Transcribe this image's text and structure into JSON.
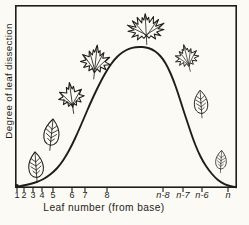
{
  "figure": {
    "title": "",
    "ylabel": "Degree of leaf dissection",
    "xlabel": "Leaf number (from base)"
  },
  "colors": {
    "ink": "#1e1d1a",
    "background": "#fbfaf5"
  },
  "axis": {
    "x_ticks": [
      {
        "label": "1",
        "x": 17,
        "italic": false
      },
      {
        "label": "2",
        "x": 24,
        "italic": false
      },
      {
        "label": "3",
        "x": 33,
        "italic": false
      },
      {
        "label": "4",
        "x": 42,
        "italic": false
      },
      {
        "label": "5",
        "x": 53,
        "italic": false
      },
      {
        "label": "6",
        "x": 72,
        "italic": false
      },
      {
        "label": "7",
        "x": 85,
        "italic": false
      },
      {
        "label": "8",
        "x": 107,
        "italic": false
      },
      {
        "label": "n-8",
        "x": 163,
        "italic": true
      },
      {
        "label": "n-7",
        "x": 183,
        "italic": true
      },
      {
        "label": "n-6",
        "x": 202,
        "italic": true
      },
      {
        "label": "n",
        "x": 228,
        "italic": true
      }
    ]
  },
  "chart_data": {
    "type": "line",
    "title": "",
    "xlabel": "Leaf number (from base)",
    "ylabel": "Degree of leaf dissection",
    "x_tick_labels": [
      "1",
      "2",
      "3",
      "4",
      "5",
      "6",
      "7",
      "8",
      "n-8",
      "n-7",
      "n-6",
      "n"
    ],
    "y_axis": {
      "scale": "qualitative, unlabeled",
      "range_shown": [
        0,
        1
      ],
      "tick_labels": []
    },
    "grid": false,
    "legend": false,
    "relative_dissection_at_ticks": [
      0.0,
      0.01,
      0.03,
      0.05,
      0.11,
      0.31,
      0.51,
      0.84,
      0.91,
      0.55,
      0.17,
      0.01
    ],
    "curve_points_px": [
      [
        16,
        187
      ],
      [
        24,
        185.5
      ],
      [
        32,
        183.5
      ],
      [
        40,
        181
      ],
      [
        47,
        177
      ],
      [
        54,
        171.5
      ],
      [
        60,
        165
      ],
      [
        66,
        156
      ],
      [
        72,
        145
      ],
      [
        78,
        132
      ],
      [
        84,
        118
      ],
      [
        90,
        104
      ],
      [
        96,
        91
      ],
      [
        102,
        79
      ],
      [
        108,
        68.5
      ],
      [
        114,
        60
      ],
      [
        120,
        54
      ],
      [
        126,
        50
      ],
      [
        132,
        47.7
      ],
      [
        139,
        46.8
      ],
      [
        146,
        47.3
      ],
      [
        152,
        49.2
      ],
      [
        158,
        53.5
      ],
      [
        163,
        59
      ],
      [
        168,
        67.5
      ],
      [
        173,
        79
      ],
      [
        178,
        93
      ],
      [
        183,
        109
      ],
      [
        188,
        124
      ],
      [
        193,
        139
      ],
      [
        198,
        151.5
      ],
      [
        203,
        161.5
      ],
      [
        209,
        170.5
      ],
      [
        215,
        177.5
      ],
      [
        221,
        182.5
      ],
      [
        228,
        185.7
      ],
      [
        236,
        187.3
      ]
    ],
    "leaf_icons": [
      {
        "name": "entire-leaf-1",
        "type": "entire",
        "cx": 36,
        "cy": 166,
        "w": 22,
        "h": 33,
        "rot": -4
      },
      {
        "name": "entire-leaf-2",
        "type": "entire",
        "cx": 51,
        "cy": 134,
        "w": 23,
        "h": 34,
        "rot": 6
      },
      {
        "name": "lobed-leaf-3",
        "type": "three-lobed",
        "cx": 71,
        "cy": 98,
        "w": 29,
        "h": 34,
        "rot": -8
      },
      {
        "name": "lobed-leaf-4",
        "type": "five-lobed",
        "cx": 95,
        "cy": 62,
        "w": 33,
        "h": 36,
        "rot": 6
      },
      {
        "name": "dissected-leaf-5",
        "type": "deeply-dissected",
        "cx": 146,
        "cy": 30,
        "w": 40,
        "h": 36,
        "rot": -3
      },
      {
        "name": "lobed-leaf-6",
        "type": "five-lobed",
        "cx": 187,
        "cy": 58,
        "w": 26,
        "h": 32,
        "rot": -14
      },
      {
        "name": "entire-leaf-7",
        "type": "entire",
        "cx": 201,
        "cy": 103,
        "w": 20,
        "h": 31,
        "rot": -4
      },
      {
        "name": "entire-leaf-8",
        "type": "entire",
        "cx": 221,
        "cy": 161,
        "w": 16,
        "h": 28,
        "rot": 3
      }
    ]
  }
}
